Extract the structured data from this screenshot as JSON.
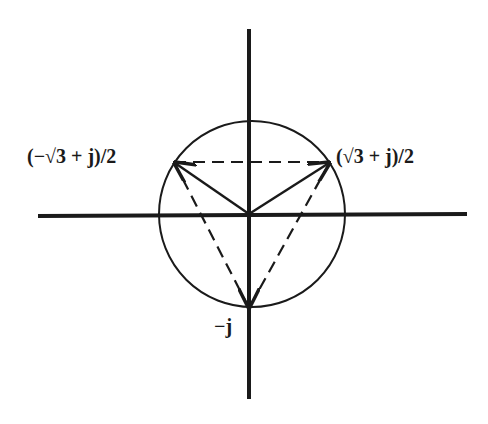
{
  "diagram": {
    "type": "complex-plane-phasor-diagram",
    "colors": {
      "background": "#ffffff",
      "ink": "#1a1a1a"
    },
    "axes": {
      "horizontal": {
        "x1": 38,
        "y1": 216,
        "x2": 467,
        "y2": 214
      },
      "vertical": {
        "x1": 249,
        "y1": 29,
        "x2": 249,
        "y2": 399
      }
    },
    "circle": {
      "cx": 252,
      "cy": 214,
      "r": 93
    },
    "origin": {
      "x": 249,
      "y": 214
    },
    "points": [
      {
        "id": "left",
        "label": "(−√3 + j)/2",
        "x": 174,
        "y": 162
      },
      {
        "id": "right",
        "label": "(√3 + j)/2",
        "x": 330,
        "y": 162
      },
      {
        "id": "bottom",
        "label": "−j",
        "x": 249,
        "y": 308
      }
    ]
  },
  "labels": {
    "left": "(−√3 + j)/2",
    "right": "(√3 + j)/2",
    "bottom": "−j"
  }
}
